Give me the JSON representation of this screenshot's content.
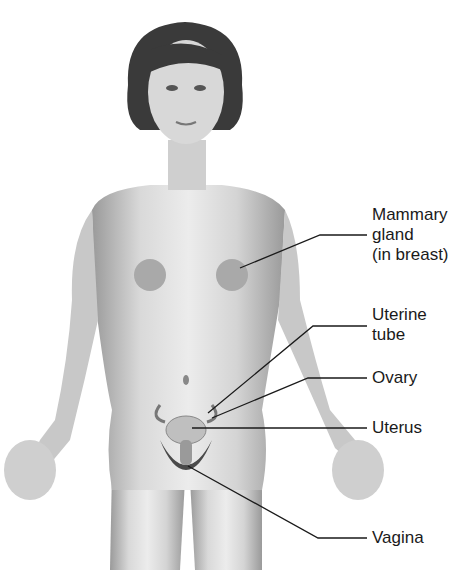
{
  "figure": {
    "type": "anatomical-illustration"
  },
  "labels": [
    {
      "id": "mammary",
      "lines": [
        "Mammary",
        "gland",
        "(in breast)"
      ]
    },
    {
      "id": "uterine_tube",
      "lines": [
        "Uterine",
        "tube"
      ]
    },
    {
      "id": "ovary",
      "lines": [
        "Ovary"
      ]
    },
    {
      "id": "uterus",
      "lines": [
        "Uterus"
      ]
    },
    {
      "id": "vagina",
      "lines": [
        "Vagina"
      ]
    }
  ],
  "colors": {
    "skin_light": "#e6e6e6",
    "skin_mid": "#bdbdbd",
    "skin_dark": "#8a8a8a",
    "hair": "#3a3a3a",
    "line": "#1a1a1a"
  }
}
